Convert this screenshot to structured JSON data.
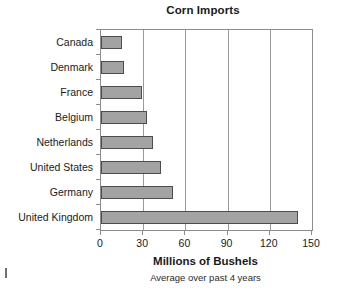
{
  "chart_data": {
    "type": "bar",
    "orientation": "horizontal",
    "title": "Corn Imports",
    "xlabel": "Millions of Bushels",
    "subtitle": "Average over past 4 years",
    "ylabel": "",
    "categories": [
      "Canada",
      "Denmark",
      "France",
      "Belgium",
      "Netherlands",
      "United States",
      "Germany",
      "United Kingdom"
    ],
    "values": [
      15,
      16,
      29,
      33,
      37,
      43,
      51,
      140
    ],
    "xlim": [
      0,
      150
    ],
    "xticks": [
      0,
      30,
      60,
      90,
      120,
      150
    ],
    "xtick_labels": [
      "0",
      "30",
      "60",
      "90",
      "120",
      "150"
    ],
    "grid": "vertical",
    "legend": "none",
    "bar_fill_color": "#a3a3a3",
    "bar_border_color": "#4d4d4d",
    "axis_color": "#8c8c8c",
    "gridline_color": "#9a9a9a",
    "text_color": "#1a1a1a"
  }
}
